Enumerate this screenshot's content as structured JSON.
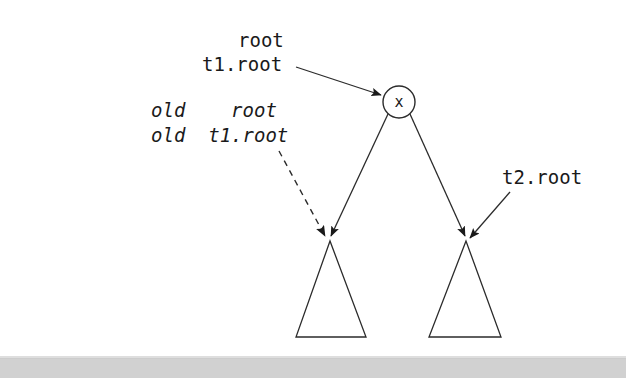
{
  "figure": {
    "type": "tree-diagram",
    "background_color": "#ffffff",
    "stroke_color": "#1a1a1a",
    "width": 626,
    "height": 378
  },
  "labels": {
    "root": "root",
    "t1_root": "t1.root",
    "old_root": "old    root",
    "old_t1_root": "old  t1.root",
    "t2_root": "t2.root",
    "node_value": "x"
  },
  "nodes": [
    {
      "name": "root-node",
      "shape": "circle",
      "label": "x",
      "cx": 399,
      "cy": 102,
      "r": 16
    },
    {
      "name": "left-subtree",
      "shape": "triangle",
      "apex_x": 330,
      "apex_y": 241,
      "base_left_x": 296,
      "base_right_x": 366,
      "base_y": 337
    },
    {
      "name": "right-subtree",
      "shape": "triangle",
      "apex_x": 466,
      "apex_y": 241,
      "base_left_x": 429,
      "base_right_x": 501,
      "base_y": 337
    }
  ],
  "edges": [
    {
      "name": "root-to-left-child",
      "style": "solid",
      "from": [
        388,
        114
      ],
      "to": [
        331,
        238
      ]
    },
    {
      "name": "root-to-right-child",
      "style": "solid",
      "from": [
        410,
        114
      ],
      "to": [
        465,
        238
      ]
    }
  ],
  "annotations": [
    {
      "name": "t1root-pointer",
      "style": "solid",
      "from": [
        296,
        67
      ],
      "to": [
        383,
        96
      ],
      "target": "root-node"
    },
    {
      "name": "old-t1root-pointer",
      "style": "dashed",
      "from": [
        279,
        151
      ],
      "to": [
        327,
        238
      ],
      "target": "left-subtree"
    },
    {
      "name": "t2root-pointer",
      "style": "solid",
      "from": [
        508,
        191
      ],
      "to": [
        469,
        238
      ],
      "target": "right-subtree"
    }
  ],
  "scan_artifact": {
    "name": "page-scan-band",
    "color": "#c9c9c9",
    "top": 358,
    "height": 20
  }
}
